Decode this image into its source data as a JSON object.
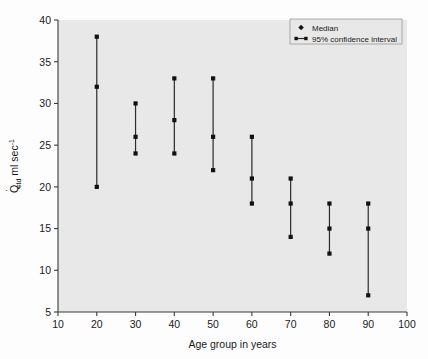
{
  "chart_data": {
    "type": "scatter",
    "title": "",
    "xlabel": "Age group in years",
    "ylabel": "Q̇std ml sec-1",
    "ylabel_parts": {
      "symbol": "Q",
      "dot": "˙",
      "subscript": "std",
      "units": "ml sec",
      "exponent": "-1"
    },
    "xlim": [
      10,
      100
    ],
    "ylim": [
      5,
      40
    ],
    "xticks": [
      10,
      20,
      30,
      40,
      50,
      60,
      70,
      80,
      90,
      100
    ],
    "xtick_labels": [
      "10",
      "20",
      "30",
      "40",
      "50",
      "60",
      "70",
      "80",
      "90",
      "100"
    ],
    "yticks": [
      5,
      10,
      15,
      20,
      25,
      30,
      35,
      40
    ],
    "ytick_labels": [
      "5",
      "10",
      "15",
      "20",
      "25",
      "30",
      "35",
      "40"
    ],
    "grid": false,
    "legend_position": "top-right",
    "legend": [
      {
        "label": "Median",
        "marker": "diamond"
      },
      {
        "label": "95% confidence interval",
        "marker": "line-with-dots"
      }
    ],
    "categories": [
      20,
      30,
      40,
      50,
      60,
      70,
      80,
      90
    ],
    "series": [
      {
        "name": "Upper 95% CI",
        "values": [
          38,
          30,
          33,
          33,
          26,
          21,
          18,
          18
        ]
      },
      {
        "name": "Median",
        "values": [
          32,
          26,
          28,
          26,
          21,
          18,
          15,
          15
        ]
      },
      {
        "name": "Lower 95% CI",
        "values": [
          20,
          24,
          24,
          22,
          18,
          14,
          12,
          7
        ]
      }
    ],
    "points": [
      {
        "x": 20,
        "upper": 38,
        "median": 32,
        "lower": 20
      },
      {
        "x": 30,
        "upper": 30,
        "median": 26,
        "lower": 24
      },
      {
        "x": 40,
        "upper": 33,
        "median": 28,
        "lower": 24
      },
      {
        "x": 50,
        "upper": 33,
        "median": 26,
        "lower": 22
      },
      {
        "x": 60,
        "upper": 26,
        "median": 21,
        "lower": 18
      },
      {
        "x": 70,
        "upper": 21,
        "median": 18,
        "lower": 14
      },
      {
        "x": 80,
        "upper": 18,
        "median": 15,
        "lower": 12
      },
      {
        "x": 90,
        "upper": 18,
        "median": 15,
        "lower": 7
      }
    ],
    "colors": {
      "plot_background": "#e8e8e8",
      "figure_background": "#fdfdfd",
      "marker": "#111111",
      "line": "#2b2b2b",
      "axis": "#3a3a3a",
      "text": "#1a1a1a"
    }
  }
}
